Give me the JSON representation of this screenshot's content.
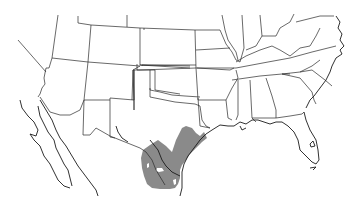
{
  "map": {
    "type": "range-map",
    "region": "Southern United States and Northern Mexico",
    "colors": {
      "background": "#ffffff",
      "borders": "#2a2a2a",
      "range_fill": "#8a8a8a"
    },
    "range": {
      "description": "Shaded distribution area covering South Texas and northeastern Mexico along the Gulf coast"
    }
  }
}
